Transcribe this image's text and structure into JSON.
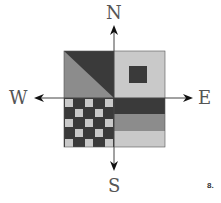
{
  "compass": {
    "north": "N",
    "south": "S",
    "east": "E",
    "west": "W"
  },
  "figure_number": "8.",
  "colors": {
    "dark": "#3a3a3a",
    "mid": "#8c8c8c",
    "light": "#c9c9c9",
    "line": "#555555",
    "arrow": "#111111"
  },
  "quadrants": {
    "northwest": "diagonal split: dark upper-right triangle, mid-gray lower-left triangle",
    "northeast": "light gray with small dark square",
    "southwest": "5x5 checkerboard of dark and light squares",
    "southeast": "three horizontal stripes: dark, mid, light"
  }
}
